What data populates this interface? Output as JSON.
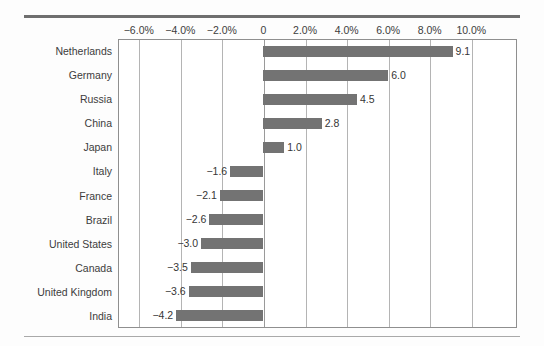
{
  "chart_data": {
    "type": "bar",
    "orientation": "horizontal",
    "title": "",
    "subtitle": "",
    "xlabel": "",
    "ylabel": "",
    "categories": [
      "Netherlands",
      "Germany",
      "Russia",
      "China",
      "Japan",
      "Italy",
      "France",
      "Brazil",
      "United States",
      "Canada",
      "United Kingdom",
      "India"
    ],
    "values": [
      9.1,
      6.0,
      4.5,
      2.8,
      1.0,
      -1.6,
      -2.1,
      -2.6,
      -3.0,
      -3.5,
      -3.6,
      -4.2
    ],
    "value_labels": [
      "9.1",
      "6.0",
      "4.5",
      "2.8",
      "1.0",
      "−1.6",
      "−2.1",
      "−2.6",
      "−3.0",
      "−3.5",
      "−3.6",
      "−4.2"
    ],
    "xlim": [
      -7.0,
      12.2
    ],
    "xticks": [
      -6,
      -4,
      -2,
      0,
      2,
      4,
      6,
      8,
      10
    ],
    "xtick_labels": [
      "−6.0%",
      "−4.0%",
      "−2.0%",
      "0",
      "2.0%",
      "4.0%",
      "6.0%",
      "8.0%",
      "10.0%"
    ],
    "grid": true,
    "grid_axis": "x",
    "legend": false,
    "legend_position": "none",
    "units": "percent",
    "bar_color": "#737373",
    "gridline_color": "#b4b4b4",
    "zero_line_color": "#9a9a9a",
    "plot_background": "#ffffff",
    "figure_background": "#fdfdfd",
    "border_color": "#8f8f8f",
    "text_color": "#3c3c3c",
    "rule_top_color": "#6f6f6f",
    "rule_bottom_color": "#a9a9a9"
  }
}
